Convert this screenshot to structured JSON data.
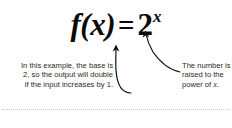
{
  "page": {
    "background_color": "#ffffff",
    "width": 232,
    "height": 128
  },
  "formula": {
    "function_name": "f(x)",
    "equals": "=",
    "base": "2",
    "exponent": "x",
    "full_text": "f(x) = 2^x",
    "color": "#0a0a0a"
  },
  "annotations": {
    "left": {
      "line1": "In this example, the base is",
      "line2": "2, so the output will double",
      "line3": "if the input increases by 1.",
      "target": "base",
      "arrow": "curved-arrow-up-left"
    },
    "right": {
      "line1": "The number is",
      "line2": "raised to the",
      "line3_prefix": "power of ",
      "line3_var": "x",
      "line3_suffix": ".",
      "target": "exponent",
      "arrow": "curved-arrow-up-right"
    },
    "text_color": "#2b2b2b"
  },
  "divider": {
    "style": "dotted",
    "color": "#c9c9c9"
  }
}
